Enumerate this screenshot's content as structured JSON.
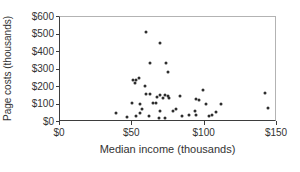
{
  "colors": {
    "background": "#ffffff",
    "axis": "#3d3d3d",
    "box_border": "#b3b3b3",
    "text": "#333333",
    "marker": "#2e2e2e"
  },
  "chart_data": {
    "type": "scatter",
    "xlabel": "Median income (thousands)",
    "ylabel": "Page costs (thousands)",
    "xlim": [
      0,
      150
    ],
    "ylim": [
      0,
      600
    ],
    "grid": false,
    "legend": "none",
    "marker": {
      "shape": "circle",
      "size_px": 3,
      "color": "#2e2e2e"
    },
    "x_ticks": [
      {
        "value": 0,
        "label": "$0"
      },
      {
        "value": 50,
        "label": "$50"
      },
      {
        "value": 100,
        "label": "$100"
      },
      {
        "value": 150,
        "label": "$150"
      }
    ],
    "y_ticks": [
      {
        "value": 0,
        "label": "$0"
      },
      {
        "value": 100,
        "label": "$100"
      },
      {
        "value": 200,
        "label": "$200"
      },
      {
        "value": 300,
        "label": "$300"
      },
      {
        "value": 400,
        "label": "$400"
      },
      {
        "value": 500,
        "label": "$500"
      },
      {
        "value": 600,
        "label": "$600"
      }
    ],
    "points": [
      [
        60,
        514
      ],
      [
        70,
        446
      ],
      [
        63,
        330
      ],
      [
        74,
        331
      ],
      [
        75,
        277
      ],
      [
        55,
        243
      ],
      [
        51,
        231
      ],
      [
        53,
        231
      ],
      [
        52,
        217
      ],
      [
        59,
        197
      ],
      [
        100,
        174
      ],
      [
        63,
        154
      ],
      [
        60,
        151
      ],
      [
        70,
        146
      ],
      [
        73,
        146
      ],
      [
        75,
        137
      ],
      [
        84,
        137
      ],
      [
        68,
        134
      ],
      [
        72,
        129
      ],
      [
        76,
        126
      ],
      [
        95,
        123
      ],
      [
        97,
        117
      ],
      [
        143,
        158
      ],
      [
        50,
        97
      ],
      [
        56,
        91
      ],
      [
        65,
        97
      ],
      [
        67,
        99
      ],
      [
        57,
        66
      ],
      [
        70,
        51
      ],
      [
        79,
        55
      ],
      [
        81,
        65
      ],
      [
        102,
        94
      ],
      [
        112,
        91
      ],
      [
        94,
        51
      ],
      [
        145,
        67
      ],
      [
        39,
        43
      ],
      [
        56,
        40
      ],
      [
        53,
        26
      ],
      [
        47,
        20
      ],
      [
        62,
        23
      ],
      [
        69,
        9
      ],
      [
        73,
        14
      ],
      [
        85,
        23
      ],
      [
        90,
        30
      ],
      [
        95,
        27
      ],
      [
        104,
        21
      ],
      [
        106,
        27
      ],
      [
        109,
        46
      ]
    ]
  }
}
